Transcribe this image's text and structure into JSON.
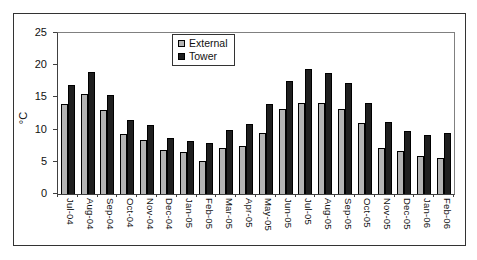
{
  "chart_data": {
    "type": "bar",
    "title": "",
    "ylabel": "°C",
    "xlabel": "",
    "ylim": [
      0,
      25
    ],
    "yticks": [
      0,
      5,
      10,
      15,
      20,
      25
    ],
    "grid": false,
    "legend_position": "top-center",
    "legend_border": true,
    "categories": [
      "Jul-04",
      "Aug-04",
      "Sep-04",
      "Oct-04",
      "Nov-04",
      "Dec-04",
      "Jan-05",
      "Feb-05",
      "Mar-05",
      "Apr-05",
      "May-05",
      "Jun-05",
      "Jul-05",
      "Aug-05",
      "Sep-05",
      "Oct-05",
      "Nov-05",
      "Dec-05",
      "Jan-06",
      "Feb-06"
    ],
    "series": [
      {
        "name": "External",
        "color": "#b3b3b3",
        "values": [
          13.9,
          15.6,
          13.1,
          9.3,
          8.4,
          6.9,
          6.6,
          5.1,
          7.2,
          7.5,
          9.4,
          13.2,
          14.2,
          14.1,
          13.2,
          11.0,
          7.1,
          6.7,
          5.9,
          5.6
        ]
      },
      {
        "name": "Tower",
        "color": "#1f1f1f",
        "values": [
          16.9,
          18.9,
          15.3,
          11.5,
          10.7,
          8.7,
          8.2,
          7.9,
          10.0,
          10.9,
          14.0,
          17.5,
          19.4,
          18.8,
          17.2,
          14.2,
          11.2,
          9.8,
          9.1,
          9.4
        ]
      }
    ],
    "colors": {
      "plot_border": "#808080",
      "axis": "#404040",
      "frame_border": "#333333",
      "background": "#ffffff",
      "bar_border": "#000000"
    }
  }
}
